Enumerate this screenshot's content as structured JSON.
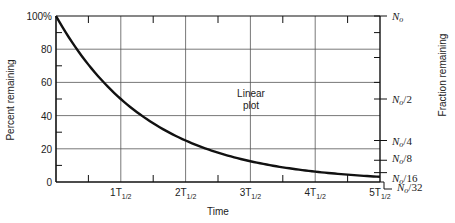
{
  "chart_data": {
    "type": "line",
    "title": "",
    "xlabel": "Time",
    "ylabel": "Percent remaining",
    "y2label": "Fraction remaining",
    "annotation": "Linear plot",
    "x_ticks": [
      "1T1/2",
      "2T1/2",
      "3T1/2",
      "4T1/2",
      "5T1/2"
    ],
    "x_tick_parts": [
      {
        "main": "1T",
        "sub": "1/2"
      },
      {
        "main": "2T",
        "sub": "1/2"
      },
      {
        "main": "3T",
        "sub": "1/2"
      },
      {
        "main": "4T",
        "sub": "1/2"
      },
      {
        "main": "5T",
        "sub": "1/2"
      }
    ],
    "y_ticks": [
      "0",
      "20",
      "40",
      "60",
      "80",
      "100%"
    ],
    "y_tick_values": [
      0,
      20,
      40,
      60,
      80,
      100
    ],
    "y2_ticks": [
      {
        "label": "N0",
        "base": "N",
        "sub": "o",
        "suffix": "",
        "value": 100
      },
      {
        "label": "N0/2",
        "base": "N",
        "sub": "o",
        "suffix": "/2",
        "value": 50
      },
      {
        "label": "N0/4",
        "base": "N",
        "sub": "o",
        "suffix": "/4",
        "value": 25
      },
      {
        "label": "N0/8",
        "base": "N",
        "sub": "o",
        "suffix": "/8",
        "value": 12.5
      },
      {
        "label": "N0/16",
        "base": "N",
        "sub": "o",
        "suffix": "/16",
        "value": 6.25
      },
      {
        "label": "N0/32",
        "base": "N",
        "sub": "o",
        "suffix": "/32",
        "value": 3.125
      }
    ],
    "series": [
      {
        "name": "Percent remaining",
        "x": [
          0,
          0.5,
          1,
          1.5,
          2,
          2.5,
          3,
          3.5,
          4,
          4.5,
          5
        ],
        "values": [
          100,
          70.7,
          50,
          35.4,
          25,
          17.7,
          12.5,
          8.8,
          6.25,
          4.4,
          3.125
        ]
      }
    ],
    "xlim": [
      0,
      5
    ],
    "ylim": [
      0,
      100
    ],
    "grid": true,
    "legend": "none"
  }
}
